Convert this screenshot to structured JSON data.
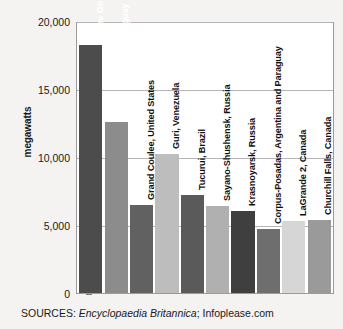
{
  "chart_data": {
    "type": "bar",
    "title": "",
    "xlabel": "",
    "ylabel": "megawatts",
    "ylim": [
      0,
      20000
    ],
    "grid": true,
    "legend": "none",
    "ytick_labels": [
      "20,000",
      "15,000",
      "10,000",
      "5,000",
      "0"
    ],
    "ytick_values": [
      20000,
      15000,
      10000,
      5000,
      0
    ],
    "categories": [
      "Three Gorges, China",
      "Itaipu, Brazil and Paraguay",
      "Grand Coulee, United States",
      "Guri, Venezuela",
      "Tucurui, Brazil",
      "Sayano-Shushensk, Russia",
      "Krasnoyarsk, Russia",
      "Corpus-Posadas, Argentina and Paraguay",
      "LaGrande 2, Canada",
      "Churchill Falls, Canada"
    ],
    "values": [
      18200,
      12600,
      6480,
      10200,
      7200,
      6400,
      6000,
      4700,
      5300,
      5400
    ],
    "bar_colors": [
      "#4c4c4c",
      "#8c8c8c",
      "#616161",
      "#bdbdbd",
      "#5a5a5a",
      "#b0b0b0",
      "#3f3f3f",
      "#6e6e6e",
      "#d6d6d6",
      "#9a9a9a"
    ],
    "label_colors": [
      "#ffffff",
      "#ffffff",
      "#111111",
      "#111111",
      "#111111",
      "#111111",
      "#111111",
      "#111111",
      "#111111",
      "#111111"
    ]
  },
  "source": {
    "prefix": "SOURCES: ",
    "italic_part": "Encyclopaedia Britannica",
    "suffix": "; Infoplease.com"
  }
}
